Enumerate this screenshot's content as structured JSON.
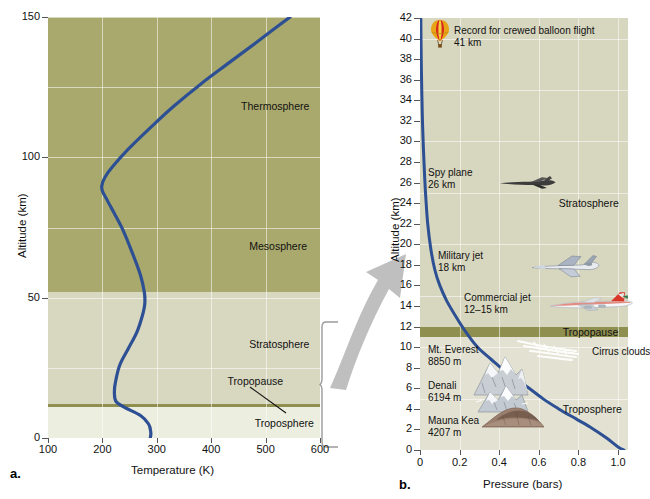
{
  "figure": {
    "panel_a_letter": "a.",
    "panel_b_letter": "b."
  },
  "chart_data": [
    {
      "id": "panel-a",
      "type": "line",
      "title": "",
      "xlabel": "Temperature (K)",
      "ylabel": "Altitude (km)",
      "xlim": [
        100,
        600
      ],
      "ylim": [
        0,
        150
      ],
      "xticks": [
        100,
        200,
        300,
        400,
        500,
        600
      ],
      "yticks": [
        0,
        50,
        100,
        150
      ],
      "xtick_labels": [
        "100",
        "200",
        "300",
        "400",
        "500",
        "600"
      ],
      "ytick_labels": [
        "0",
        "50",
        "100",
        "150"
      ],
      "grid": true,
      "legend": "none",
      "series": [
        {
          "name": "Temperature profile",
          "color": "#2d4f93",
          "points": [
            [
              288,
              0
            ],
            [
              289,
              2
            ],
            [
              285,
              5
            ],
            [
              270,
              8
            ],
            [
              240,
              11
            ],
            [
              225,
              13
            ],
            [
              222,
              16
            ],
            [
              224,
              20
            ],
            [
              232,
              26
            ],
            [
              248,
              32
            ],
            [
              264,
              38
            ],
            [
              274,
              44
            ],
            [
              278,
              48
            ],
            [
              277,
              52
            ],
            [
              270,
              58
            ],
            [
              255,
              66
            ],
            [
              238,
              74
            ],
            [
              222,
              80
            ],
            [
              208,
              85
            ],
            [
              200,
              88
            ],
            [
              199,
              90
            ],
            [
              205,
              93
            ],
            [
              220,
              97
            ],
            [
              248,
              103
            ],
            [
              285,
              110
            ],
            [
              330,
              118
            ],
            [
              380,
              126
            ],
            [
              435,
              134
            ],
            [
              490,
              142
            ],
            [
              545,
              150
            ]
          ]
        }
      ],
      "layers": [
        {
          "name": "Troposphere",
          "y_from": 0,
          "y_to": 11,
          "color": "#eceee0",
          "label_y": 5,
          "label_x": 480
        },
        {
          "name": "Tropopause",
          "y_from": 11,
          "y_to": 12,
          "color": "#8f8f50",
          "label_y": 20,
          "label_x": 430
        },
        {
          "name": "Stratosphere",
          "y_from": 12,
          "y_to": 52,
          "color": "#d8d7c0",
          "label_y": 33,
          "label_x": 470
        },
        {
          "name": "Mesosphere",
          "y_from": 52,
          "y_to": 87,
          "color": "#a9a96d",
          "label_y": 68,
          "label_x": 470
        },
        {
          "name": "Thermosphere",
          "y_from": 87,
          "y_to": 150,
          "color": "#a9a96d",
          "label_y": 118,
          "label_x": 455
        }
      ]
    },
    {
      "id": "panel-b",
      "type": "line",
      "title": "",
      "xlabel": "Pressure (bars)",
      "ylabel": "Altitude (km)",
      "xlim": [
        0,
        1.05
      ],
      "ylim": [
        0,
        42
      ],
      "xticks": [
        0,
        0.2,
        0.4,
        0.6,
        0.8,
        1.0
      ],
      "yticks": [
        0,
        2,
        4,
        6,
        8,
        10,
        12,
        14,
        16,
        18,
        20,
        22,
        24,
        26,
        28,
        30,
        32,
        34,
        36,
        38,
        40,
        42
      ],
      "xtick_labels": [
        "0",
        "0.2",
        "0.4",
        "0.6",
        "0.8",
        "1.0"
      ],
      "ytick_labels": [
        "0",
        "2",
        "4",
        "6",
        "8",
        "10",
        "12",
        "14",
        "16",
        "18",
        "20",
        "22",
        "24",
        "26",
        "28",
        "30",
        "32",
        "34",
        "36",
        "38",
        "40",
        "42"
      ],
      "grid": true,
      "legend": "none",
      "series": [
        {
          "name": "Pressure profile",
          "color": "#2d4f93",
          "points": [
            [
              0.004,
              42
            ],
            [
              0.005,
              40
            ],
            [
              0.007,
              37
            ],
            [
              0.01,
              34
            ],
            [
              0.014,
              31
            ],
            [
              0.02,
              28
            ],
            [
              0.028,
              25
            ],
            [
              0.039,
              22
            ],
            [
              0.055,
              19.5
            ],
            [
              0.075,
              17.5
            ],
            [
              0.1,
              16
            ],
            [
              0.135,
              14.5
            ],
            [
              0.18,
              13
            ],
            [
              0.23,
              11.5
            ],
            [
              0.29,
              10
            ],
            [
              0.36,
              8.8
            ],
            [
              0.44,
              7.5
            ],
            [
              0.53,
              6.3
            ],
            [
              0.62,
              5.0
            ],
            [
              0.7,
              4.0
            ],
            [
              0.79,
              3.0
            ],
            [
              0.87,
              2.1
            ],
            [
              0.94,
              1.2
            ],
            [
              1.0,
              0.3
            ],
            [
              1.03,
              0
            ]
          ]
        }
      ],
      "layers": [
        {
          "name": "Troposphere",
          "y_from": 0,
          "y_to": 11,
          "color": "#e3e2d2",
          "label_y": 4,
          "label_x": 0.72
        },
        {
          "name": "Tropopause",
          "y_from": 11,
          "y_to": 12,
          "color": "#8f8f50",
          "label_y": 11.5,
          "label_x": 0.72
        },
        {
          "name": "Stratosphere",
          "y_from": 12,
          "y_to": 42,
          "color": "#d7d6be",
          "label_y": 24,
          "label_x": 0.7
        }
      ],
      "annotations": [
        {
          "id": "balloon",
          "icon": "hot-air-balloon-icon",
          "label_line1": "Record for crewed balloon flight",
          "label_line2": "41 km",
          "altitude_km": 41
        },
        {
          "id": "spy-plane",
          "icon": "spy-plane-icon",
          "label_line1": "Spy plane",
          "label_line2": "26 km",
          "altitude_km": 26
        },
        {
          "id": "military-jet",
          "icon": "military-jet-icon",
          "label_line1": "Military jet",
          "label_line2": "18 km",
          "altitude_km": 18
        },
        {
          "id": "commercial-jet",
          "icon": "commercial-jet-icon",
          "label_line1": "Commercial jet",
          "label_line2": "12–15 km",
          "altitude_km": 14
        },
        {
          "id": "cirrus",
          "icon": "cirrus-clouds-icon",
          "label_line1": "Cirrus clouds",
          "label_line2": "",
          "altitude_km": 10
        },
        {
          "id": "everest",
          "icon": "snow-mountain-icon",
          "label_line1": "Mt. Everest",
          "label_line2": "8850 m",
          "altitude_km": 8.85
        },
        {
          "id": "denali",
          "icon": "snow-mountain-icon",
          "label_line1": "Denali",
          "label_line2": "6194 m",
          "altitude_km": 6.19
        },
        {
          "id": "maunakea",
          "icon": "brown-mountain-icon",
          "label_line1": "Mauna Kea",
          "label_line2": "4207 m",
          "altitude_km": 4.21
        }
      ]
    }
  ]
}
